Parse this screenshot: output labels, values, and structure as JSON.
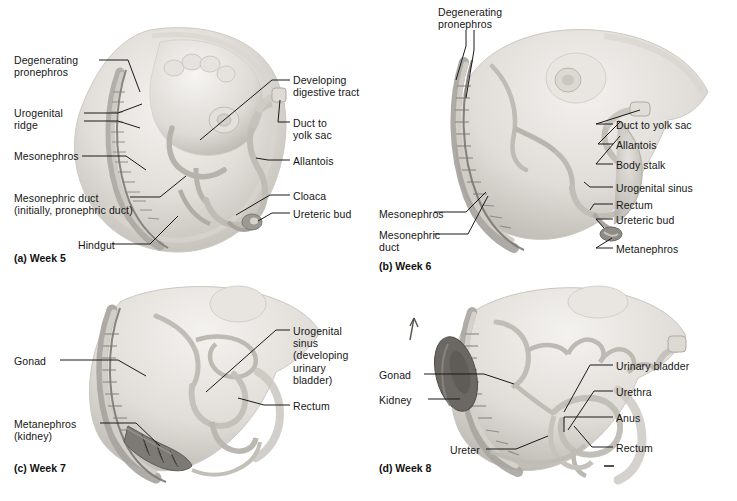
{
  "figure": {
    "type": "anatomical-illustration",
    "style": "grayscale shaded medical illustration, lateral view of embryo"
  },
  "panels": [
    {
      "id": "a",
      "caption": "(a) Week 5",
      "labels_left": [
        {
          "text": "Degenerating\npronephros",
          "x": 14,
          "y": 54
        },
        {
          "text": "Urogenital\nridge",
          "x": 14,
          "y": 107
        },
        {
          "text": "Mesonephros",
          "x": 14,
          "y": 150
        },
        {
          "text": "Mesonephric duct\n(initially, pronephric duct)",
          "x": 14,
          "y": 192
        },
        {
          "text": "Hindgut",
          "x": 78,
          "y": 239
        }
      ],
      "labels_right": [
        {
          "text": "Developing\ndigestive tract",
          "x": 293,
          "y": 74
        },
        {
          "text": "Duct to\nyolk sac",
          "x": 293,
          "y": 117
        },
        {
          "text": "Allantois",
          "x": 293,
          "y": 155
        },
        {
          "text": "Cloaca",
          "x": 293,
          "y": 190
        },
        {
          "text": "Ureteric bud",
          "x": 293,
          "y": 208
        }
      ]
    },
    {
      "id": "b",
      "caption": "(b) Week 6",
      "labels_top": [
        {
          "text": "Degenerating\npronephros",
          "x": 438,
          "y": 6
        }
      ],
      "labels_left": [
        {
          "text": "Mesonephros",
          "x": 379,
          "y": 208
        },
        {
          "text": "Mesonephric\nduct",
          "x": 379,
          "y": 229
        }
      ],
      "labels_right": [
        {
          "text": "Duct to yolk sac",
          "x": 616,
          "y": 119
        },
        {
          "text": "Allantois",
          "x": 616,
          "y": 139
        },
        {
          "text": "Body stalk",
          "x": 616,
          "y": 159
        },
        {
          "text": "Urogenital sinus",
          "x": 616,
          "y": 182
        },
        {
          "text": "Rectum",
          "x": 616,
          "y": 199
        },
        {
          "text": "Ureteric bud",
          "x": 616,
          "y": 214
        },
        {
          "text": "Metanephros",
          "x": 616,
          "y": 243
        }
      ]
    },
    {
      "id": "c",
      "caption": "(c) Week 7",
      "labels_left": [
        {
          "text": "Gonad",
          "x": 14,
          "y": 355
        },
        {
          "text": "Metanephros\n(kidney)",
          "x": 14,
          "y": 418
        }
      ],
      "labels_right": [
        {
          "text": "Urogenital\nsinus\n(developing\nurinary\nbladder)",
          "x": 293,
          "y": 325
        },
        {
          "text": "Rectum",
          "x": 293,
          "y": 400
        }
      ]
    },
    {
      "id": "d",
      "caption": "(d) Week 8",
      "labels_left": [
        {
          "text": "Gonad",
          "x": 379,
          "y": 369
        },
        {
          "text": "Kidney",
          "x": 379,
          "y": 394
        }
      ],
      "labels_right": [
        {
          "text": "Urinary bladder",
          "x": 616,
          "y": 360
        },
        {
          "text": "Urethra",
          "x": 616,
          "y": 386
        },
        {
          "text": "Anus",
          "x": 616,
          "y": 412
        },
        {
          "text": "Rectum",
          "x": 616,
          "y": 442
        }
      ],
      "labels_bottom": [
        {
          "text": "Ureter",
          "x": 450,
          "y": 444
        }
      ]
    }
  ],
  "colors": {
    "leader_line": "#1a1a1a",
    "body_light": "#eceae6",
    "body_mid": "#d6d3ce",
    "body_shadow": "#b9b5af",
    "duct_outline": "#8d8a85",
    "kidney_dark": "#6f6c68",
    "kidney_darker": "#57544f",
    "text": "#161616",
    "background": "#ffffff"
  }
}
